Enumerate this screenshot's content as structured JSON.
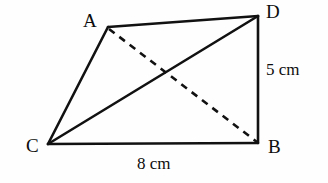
{
  "figure": {
    "kind": "quadrilateral-with-diagonals",
    "canvas": {
      "width": 328,
      "height": 183
    },
    "background_color": "#fefefe",
    "stroke_color": "#111111",
    "solid_stroke_width": 2.6,
    "dashed_stroke_width": 2.6,
    "dash_pattern": "7 6",
    "vertices": [
      {
        "name": "A",
        "label": "A",
        "x": 108,
        "y": 27,
        "label_x": 83,
        "label_y": 11
      },
      {
        "name": "D",
        "label": "D",
        "x": 258,
        "y": 16,
        "label_x": 266,
        "label_y": 2
      },
      {
        "name": "C",
        "label": "C",
        "x": 48,
        "y": 144,
        "label_x": 26,
        "label_y": 136
      },
      {
        "name": "B",
        "label": "B",
        "x": 258,
        "y": 143,
        "label_x": 268,
        "label_y": 137
      }
    ],
    "edges": [
      {
        "name": "edge-A-D",
        "from": "A",
        "to": "D",
        "style": "solid"
      },
      {
        "name": "edge-D-B",
        "from": "D",
        "to": "B",
        "style": "solid"
      },
      {
        "name": "edge-C-B",
        "from": "C",
        "to": "B",
        "style": "solid"
      },
      {
        "name": "edge-C-A",
        "from": "C",
        "to": "A",
        "style": "solid"
      }
    ],
    "diagonals": [
      {
        "name": "diagonal-C-D",
        "from": "C",
        "to": "D",
        "style": "solid"
      },
      {
        "name": "diagonal-A-B",
        "from": "A",
        "to": "B",
        "style": "dashed"
      }
    ],
    "measurements": [
      {
        "name": "side-DB-length",
        "edge": "D-B",
        "text": "5 cm",
        "x": 266,
        "y": 61
      },
      {
        "name": "side-CB-length",
        "edge": "C-B",
        "text": "8 cm",
        "x": 137,
        "y": 155
      }
    ]
  }
}
